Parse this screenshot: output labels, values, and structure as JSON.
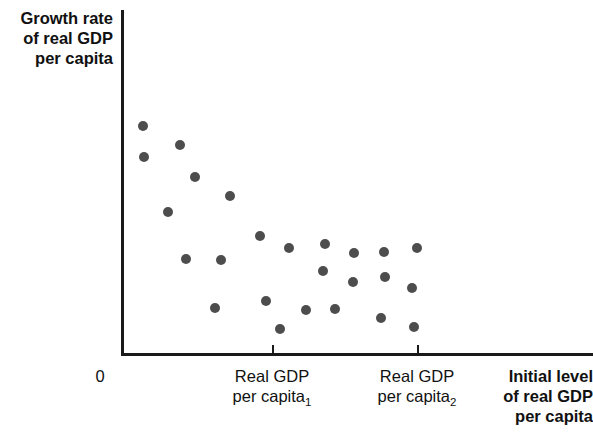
{
  "figure": {
    "width": 593,
    "height": 445,
    "background": "#ffffff",
    "marker_color": "#4d4d4d",
    "axis_color": "#1a1a1a"
  },
  "axes": {
    "y_title_line1": "Growth rate",
    "y_title_line2": "of real GDP",
    "y_title_line3": "per capita",
    "x_title_line1": "Initial level",
    "x_title_line2": "of real GDP",
    "x_title_line3": "per capita",
    "origin_label": "0",
    "tick1_line1": "Real GDP",
    "tick1_line2_text": "per capita",
    "tick1_line2_sub": "1",
    "tick2_line1": "Real GDP",
    "tick2_line2_text": "per capita",
    "tick2_line2_sub": "2"
  },
  "chart_data": {
    "type": "scatter",
    "title": "",
    "xlabel": "Initial level of real GDP per capita",
    "ylabel": "Growth rate of real GDP per capita",
    "grid": false,
    "legend": "none",
    "annotations": [],
    "xtick_labels": [
      "0",
      "Real GDP per capita₁",
      "Real GDP per capita₂"
    ],
    "xtick_pixels": [
      121,
      272,
      417
    ],
    "ytick_labels": [],
    "xlim_pixels": [
      121,
      593
    ],
    "ylim_pixels": [
      10,
      353
    ],
    "points_pixels": [
      {
        "x": 143,
        "y": 126
      },
      {
        "x": 180,
        "y": 145
      },
      {
        "x": 144,
        "y": 157
      },
      {
        "x": 195,
        "y": 177
      },
      {
        "x": 230,
        "y": 196
      },
      {
        "x": 168,
        "y": 212
      },
      {
        "x": 260,
        "y": 236
      },
      {
        "x": 289,
        "y": 248
      },
      {
        "x": 325,
        "y": 244
      },
      {
        "x": 354,
        "y": 253
      },
      {
        "x": 384,
        "y": 252
      },
      {
        "x": 417,
        "y": 248
      },
      {
        "x": 186,
        "y": 259
      },
      {
        "x": 221,
        "y": 260
      },
      {
        "x": 323,
        "y": 271
      },
      {
        "x": 353,
        "y": 282
      },
      {
        "x": 385,
        "y": 277
      },
      {
        "x": 412,
        "y": 288
      },
      {
        "x": 215,
        "y": 308
      },
      {
        "x": 266,
        "y": 301
      },
      {
        "x": 280,
        "y": 329
      },
      {
        "x": 306,
        "y": 310
      },
      {
        "x": 335,
        "y": 309
      },
      {
        "x": 381,
        "y": 318
      },
      {
        "x": 414,
        "y": 327
      }
    ]
  }
}
